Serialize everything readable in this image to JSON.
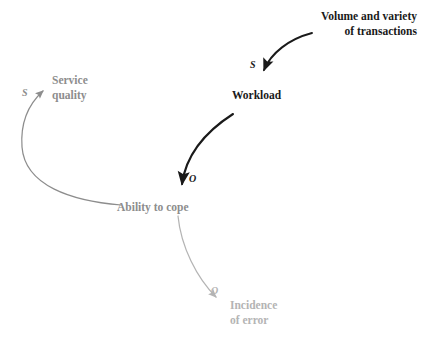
{
  "diagram": {
    "background_color": "#ffffff",
    "colors": {
      "primary": "#1a1a1a",
      "secondary": "#8d8d8d",
      "tertiary": "#b4b4b4"
    },
    "nodes": [
      {
        "id": "transactions",
        "line1": "Volume and variety",
        "line2": "of transactions",
        "emphasis": "primary"
      },
      {
        "id": "workload",
        "line1": "Workload",
        "line2": "",
        "emphasis": "primary"
      },
      {
        "id": "service_quality",
        "line1": "Service",
        "line2": "quality",
        "emphasis": "secondary"
      },
      {
        "id": "ability_to_cope",
        "line1": "Ability to cope",
        "line2": "",
        "emphasis": "secondary"
      },
      {
        "id": "incidence_of_error",
        "line1": "Incidence",
        "line2": "of error",
        "emphasis": "tertiary"
      }
    ],
    "links": [
      {
        "id": "transactions-to-workload",
        "from": "transactions",
        "to": "workload",
        "polarity": "S",
        "emphasis": "primary"
      },
      {
        "id": "workload-to-ability",
        "from": "workload",
        "to": "ability_to_cope",
        "polarity": "O",
        "emphasis": "primary"
      },
      {
        "id": "ability-to-service-quality",
        "from": "ability_to_cope",
        "to": "service_quality",
        "polarity": "S",
        "emphasis": "secondary"
      },
      {
        "id": "ability-to-incidence",
        "from": "ability_to_cope",
        "to": "incidence_of_error",
        "polarity": "O",
        "emphasis": "tertiary"
      }
    ]
  }
}
